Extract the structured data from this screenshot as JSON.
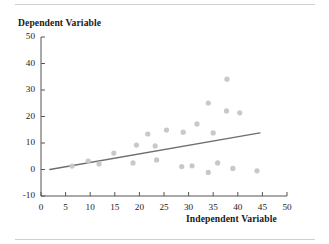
{
  "figure": {
    "has_top_rule": true,
    "has_bottom_rule": true,
    "rule_color": "#cfcfcf",
    "background": "#ffffff"
  },
  "chart_data": {
    "type": "scatter",
    "title": "",
    "xlabel": "Independent Variable",
    "ylabel": "Dependent Variable",
    "xlim": [
      0,
      50
    ],
    "ylim": [
      -10,
      50
    ],
    "xticks": [
      0,
      5,
      10,
      15,
      20,
      25,
      30,
      35,
      40,
      45,
      50
    ],
    "xtick_labels": [
      "0",
      "5",
      "10",
      "15",
      "20",
      "25",
      "30",
      "35",
      "40",
      "45",
      "50"
    ],
    "yticks": [
      -10,
      0,
      10,
      20,
      30,
      40,
      50
    ],
    "ytick_labels": [
      "-10",
      "0",
      "10",
      "20",
      "30",
      "40",
      "50"
    ],
    "grid": false,
    "legend": null,
    "marker_color": "#c8c8c8",
    "marker_radius": 2.6,
    "axis_color": "#555555",
    "points": [
      {
        "x": 6.3,
        "y": 1.3
      },
      {
        "x": 9.6,
        "y": 3.2
      },
      {
        "x": 11.8,
        "y": 2.1
      },
      {
        "x": 14.8,
        "y": 6.2
      },
      {
        "x": 18.7,
        "y": 2.5
      },
      {
        "x": 19.4,
        "y": 9.2
      },
      {
        "x": 21.7,
        "y": 13.4
      },
      {
        "x": 23.2,
        "y": 8.9
      },
      {
        "x": 23.5,
        "y": 3.6
      },
      {
        "x": 25.5,
        "y": 14.9
      },
      {
        "x": 28.6,
        "y": 1.1
      },
      {
        "x": 28.9,
        "y": 14.1
      },
      {
        "x": 30.7,
        "y": 1.4
      },
      {
        "x": 31.7,
        "y": 17.2
      },
      {
        "x": 34.0,
        "y": 25.1
      },
      {
        "x": 34.0,
        "y": -1.1
      },
      {
        "x": 35.0,
        "y": 13.8
      },
      {
        "x": 35.9,
        "y": 2.5
      },
      {
        "x": 37.7,
        "y": 22.1
      },
      {
        "x": 37.8,
        "y": 34.1
      },
      {
        "x": 39.0,
        "y": 0.4
      },
      {
        "x": 40.4,
        "y": 21.4
      },
      {
        "x": 43.9,
        "y": -0.5
      }
    ],
    "trendline": {
      "color": "#6e6e6e",
      "width": 1.4,
      "x_start": 1.8,
      "y_start": 0.0,
      "x_end": 44.5,
      "y_end": 13.8
    }
  }
}
